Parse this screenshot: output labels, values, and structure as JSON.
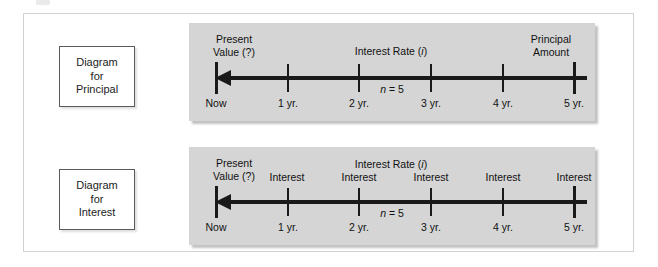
{
  "figure": {
    "type": "time-value-of-money-diagram",
    "panels": [
      {
        "id": "principal",
        "side_label": {
          "lines": [
            "Diagram",
            "for",
            "Principal"
          ]
        },
        "headers": {
          "present_value": [
            "Present",
            "Value (?)"
          ],
          "interest_rate": "Interest Rate (i)",
          "interest_rate_italic": "i",
          "right": [
            "Principal",
            "Amount"
          ]
        },
        "n_label": "n = 5",
        "n_italic": "n",
        "n_value": 5,
        "ticks": [
          {
            "label": "Now",
            "year": 0
          },
          {
            "label": "1 yr.",
            "year": 1
          },
          {
            "label": "2 yr.",
            "year": 2
          },
          {
            "label": "3 yr.",
            "year": 3
          },
          {
            "label": "4 yr.",
            "year": 4
          },
          {
            "label": "5 yr.",
            "year": 5
          }
        ],
        "arrow_direction": "left"
      },
      {
        "id": "interest",
        "side_label": {
          "lines": [
            "Diagram",
            "for",
            "Interest"
          ]
        },
        "headers": {
          "present_value": [
            "Present",
            "Value (?)"
          ],
          "interest_rate": "Interest Rate (i)",
          "interest_rate_italic": "i",
          "period_labels": [
            "Interest",
            "Interest",
            "Interest",
            "Interest",
            "Interest"
          ]
        },
        "n_label": "n = 5",
        "n_italic": "n",
        "n_value": 5,
        "ticks": [
          {
            "label": "Now",
            "year": 0
          },
          {
            "label": "1 yr.",
            "year": 1
          },
          {
            "label": "2 yr.",
            "year": 2
          },
          {
            "label": "3 yr.",
            "year": 3
          },
          {
            "label": "4 yr.",
            "year": 4
          },
          {
            "label": "5 yr.",
            "year": 5
          }
        ],
        "arrow_direction": "left"
      }
    ],
    "colors": {
      "panel_background": "#d5d5d5",
      "axis": "#1a1a1a",
      "text": "#111111",
      "frame_border": "#d2d2d2",
      "label_box_border": "#5a5a5a",
      "page_background": "#ffffff"
    }
  }
}
